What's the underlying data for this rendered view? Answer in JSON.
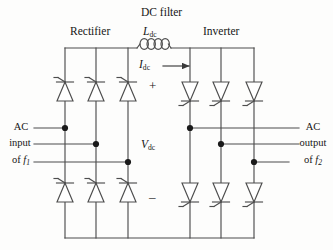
{
  "diagram": {
    "title": "DC filter",
    "sections": {
      "rectifier": "Rectifier",
      "inverter": "Inverter"
    },
    "components": {
      "inductor_label": "L",
      "inductor_sub": "dc",
      "current_label": "I",
      "current_sub": "dc",
      "voltage_label": "V",
      "voltage_sub": "dc",
      "plus_sign": "+",
      "minus_sign": "–"
    },
    "ports": {
      "input": {
        "line1": "AC",
        "line2": "input",
        "line3_prefix": "of ",
        "line3_sym": "f",
        "line3_sub": "1"
      },
      "output": {
        "line1": "AC",
        "line2": "output",
        "line3_prefix": "of ",
        "line3_sym": "f",
        "line3_sub": "2"
      }
    },
    "colors": {
      "line": "#4d4d4d",
      "text": "#161616",
      "background": "#fdfdfc",
      "node": "#1a1a1a"
    },
    "counts": {
      "rectifier_thyristors": 6,
      "inverter_thyristors": 6,
      "inductor_coils": 4,
      "phase_legs": 3
    }
  }
}
